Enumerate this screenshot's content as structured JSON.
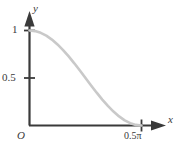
{
  "figure": {
    "background_color": "#ffffff",
    "axis_color": "#3a3a3a",
    "curve_color": "#c9c9c9"
  },
  "axes": {
    "x_axis_label": "x",
    "y_axis_label": "y",
    "origin_label": "O"
  },
  "ticks": {
    "y": [
      {
        "label": "1",
        "value": 1
      },
      {
        "label": "0.5",
        "value": 0.5
      }
    ],
    "x": [
      {
        "label": "0.5π",
        "value": 1.5707963
      }
    ]
  },
  "chart_data": {
    "type": "line",
    "title": "",
    "xlabel": "x",
    "ylabel": "y",
    "xlim": [
      0,
      1.5707963
    ],
    "ylim": [
      0,
      1
    ],
    "grid": false,
    "legend": null,
    "series": [
      {
        "name": "y = cos^2(x)",
        "color": "#c9c9c9",
        "x": [
          0.0,
          0.0785,
          0.1571,
          0.2356,
          0.3142,
          0.3927,
          0.4712,
          0.5498,
          0.6283,
          0.7069,
          0.7854,
          0.8639,
          0.9425,
          1.021,
          1.0996,
          1.1781,
          1.2566,
          1.3352,
          1.4137,
          1.4923,
          1.5708
        ],
        "y": [
          1.0,
          0.9938,
          0.9755,
          0.9455,
          0.9045,
          0.8536,
          0.7939,
          0.727,
          0.6545,
          0.5782,
          0.5,
          0.4218,
          0.3455,
          0.273,
          0.2061,
          0.1464,
          0.0955,
          0.0545,
          0.0245,
          0.0062,
          0.0
        ]
      }
    ],
    "x_tick_labels": [
      "0.5π"
    ],
    "x_tick_values": [
      1.5707963
    ],
    "y_tick_labels": [
      "0.5",
      "1"
    ],
    "y_tick_values": [
      0.5,
      1.0
    ]
  }
}
